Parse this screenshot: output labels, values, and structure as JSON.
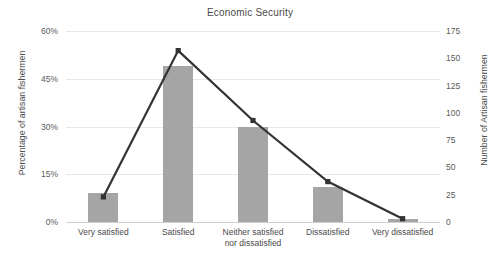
{
  "chart_data": {
    "type": "bar",
    "title": "Economic Security",
    "xlabel": "",
    "ylabel": "Percentage of artisan fishermen",
    "y2label": "Number of Artisan fishermen",
    "categories": [
      "Very satisfied",
      "Satisfied",
      "Neither satisfied nor dissatisfied",
      "Dissatisfied",
      "Very dissatisfied"
    ],
    "category_lines": [
      [
        "Very satisfied"
      ],
      [
        "Satisfied"
      ],
      [
        "Neither satisfied",
        "nor dissatisfied"
      ],
      [
        "Dissatisfied"
      ],
      [
        "Very dissatisfied"
      ]
    ],
    "series": [
      {
        "name": "Percentage of artisan fishermen",
        "type": "bar",
        "axis": "left",
        "values": [
          9,
          49,
          30,
          11,
          1
        ],
        "color": "#a5a5a5"
      },
      {
        "name": "Number of Artisan fishermen",
        "type": "line",
        "axis": "right",
        "values": [
          23,
          157,
          93,
          37,
          3
        ],
        "color": "#333333"
      }
    ],
    "ylim": [
      0,
      60
    ],
    "yticks": [
      0,
      15,
      30,
      45,
      60
    ],
    "ytick_labels": [
      "0%",
      "15%",
      "30%",
      "45%",
      "60%"
    ],
    "y2lim": [
      0,
      175
    ],
    "y2ticks": [
      0,
      25,
      50,
      75,
      100,
      125,
      150,
      175
    ],
    "y2tick_labels": [
      "0",
      "25",
      "50",
      "75",
      "100",
      "125",
      "150",
      "175"
    ],
    "grid": true,
    "legend": "none"
  }
}
